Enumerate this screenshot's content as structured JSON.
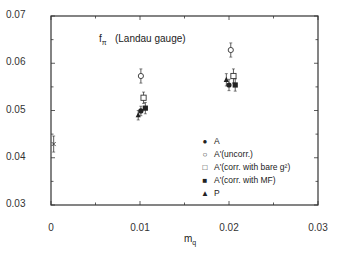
{
  "chart_data": {
    "type": "scatter",
    "title_main": "f",
    "title_sub": "π",
    "title_note": "(Landau gauge)",
    "xlabel": "m_q",
    "xlabel_main": "m",
    "xlabel_sub": "q",
    "ylabel": "",
    "xlim": [
      0,
      0.03
    ],
    "ylim": [
      0.03,
      0.07
    ],
    "x_ticks": [
      "0",
      "0.01",
      "0.02",
      "0.03"
    ],
    "y_ticks": [
      "0.03",
      "0.04",
      "0.05",
      "0.06",
      "0.07"
    ],
    "grid": false,
    "legend_position": "inside lower right",
    "series": [
      {
        "name": "A",
        "marker": "filled-circle",
        "points": [
          {
            "x": 0.0101,
            "y": 0.0499,
            "err": 0.001
          },
          {
            "x": 0.02,
            "y": 0.0554,
            "err": 0.0012
          }
        ]
      },
      {
        "name": "A'(uncorr.)",
        "marker": "open-circle",
        "points": [
          {
            "x": 0.0101,
            "y": 0.0573,
            "err": 0.0015
          },
          {
            "x": 0.0202,
            "y": 0.0628,
            "err": 0.0015
          }
        ]
      },
      {
        "name": "A'(corr. with bare g²)",
        "marker": "open-square",
        "points": [
          {
            "x": 0.0104,
            "y": 0.0527,
            "err": 0.0012
          },
          {
            "x": 0.0205,
            "y": 0.0573,
            "err": 0.0015
          }
        ]
      },
      {
        "name": "A'(corr. with MF)",
        "marker": "filled-square",
        "points": [
          {
            "x": 0.0106,
            "y": 0.0505,
            "err": 0.0012
          },
          {
            "x": 0.0207,
            "y": 0.0554,
            "err": 0.0013
          }
        ]
      },
      {
        "name": "P",
        "marker": "filled-triangle",
        "points": [
          {
            "x": 0.0098,
            "y": 0.049,
            "err": 0.001
          },
          {
            "x": 0.0197,
            "y": 0.0565,
            "err": 0.0013
          }
        ]
      },
      {
        "name": "extrapolation",
        "marker": "cross",
        "points": [
          {
            "x": 0.0003,
            "y": 0.0429,
            "err": 0.0017
          }
        ]
      }
    ]
  },
  "legend": [
    {
      "symbol": "●",
      "label": "A"
    },
    {
      "symbol": "○",
      "label": "A'(uncorr.)"
    },
    {
      "symbol": "□",
      "label": "A'(corr. with  bare g²)"
    },
    {
      "symbol": "■",
      "label": "A'(corr. with  MF)"
    },
    {
      "symbol": "▲",
      "label": "P"
    }
  ]
}
